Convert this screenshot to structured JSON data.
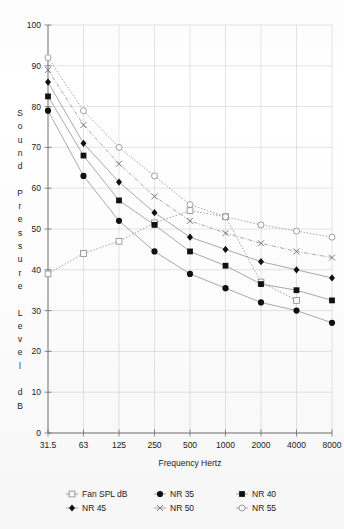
{
  "chart_data": {
    "type": "line",
    "title": "",
    "xlabel": "Frequency Hertz",
    "ylabel": "Sound Pressure Level dB",
    "categories": [
      "31.5",
      "63",
      "125",
      "250",
      "500",
      "1000",
      "2000",
      "4000",
      "8000"
    ],
    "ylim": [
      0,
      100
    ],
    "yticks": [
      0,
      10,
      20,
      30,
      40,
      50,
      60,
      70,
      80,
      90,
      100
    ],
    "grid": true,
    "legend_position": "bottom",
    "series": [
      {
        "name": "Fan SPL dB",
        "marker": "open-square",
        "line": "dotted",
        "values": [
          39,
          44,
          47,
          51.5,
          54.5,
          53,
          37,
          32.5,
          null
        ]
      },
      {
        "name": "NR 35",
        "marker": "filled-circle",
        "line": "solid",
        "values": [
          79,
          63,
          52,
          44.5,
          39,
          35.5,
          32,
          30,
          27
        ]
      },
      {
        "name": "NR 40",
        "marker": "filled-square",
        "line": "solid",
        "values": [
          82.5,
          68,
          57,
          51,
          44.5,
          41,
          36.5,
          35,
          32.5
        ]
      },
      {
        "name": "NR 45",
        "marker": "filled-diamond",
        "line": "solid",
        "values": [
          86,
          71,
          61.5,
          54,
          48,
          45,
          42,
          40,
          38
        ]
      },
      {
        "name": "NR 50",
        "marker": "cross-x",
        "line": "dashdot",
        "values": [
          89,
          75.5,
          66,
          58,
          52,
          49,
          46.5,
          44.5,
          43
        ]
      },
      {
        "name": "NR 55",
        "marker": "open-circle",
        "line": "dotted",
        "values": [
          92,
          79,
          70,
          63,
          56,
          53,
          51,
          49.5,
          48
        ]
      }
    ]
  },
  "axes": {
    "y_label_chars": [
      "S",
      "o",
      "u",
      "n",
      "d",
      "",
      "P",
      "r",
      "e",
      "s",
      "s",
      "u",
      "r",
      "e",
      "",
      "L",
      "e",
      "v",
      "e",
      "l",
      "",
      "d",
      "B"
    ],
    "y_tick_labels": [
      "100",
      "90",
      "80",
      "70",
      "60",
      "50",
      "40",
      "30",
      "20",
      "10",
      "0"
    ],
    "x_tick_labels": [
      "31.5",
      "63",
      "125",
      "250",
      "500",
      "1000",
      "2000",
      "4000",
      "8000"
    ],
    "x_axis_title": "Frequency Hertz"
  },
  "legend": {
    "entries": [
      {
        "label": "Fan SPL dB",
        "marker": "open-square"
      },
      {
        "label": "NR 35",
        "marker": "filled-circle"
      },
      {
        "label": "NR 40",
        "marker": "filled-square"
      },
      {
        "label": "NR 45",
        "marker": "filled-diamond"
      },
      {
        "label": "NR 50",
        "marker": "cross-x"
      },
      {
        "label": "NR 55",
        "marker": "open-circle"
      }
    ]
  },
  "colors": {
    "grid": "#c9c9c9",
    "axis": "#6e6e6e",
    "line": "#8e8e8e",
    "marker_fill": "#111111",
    "background": "#ffffff"
  }
}
